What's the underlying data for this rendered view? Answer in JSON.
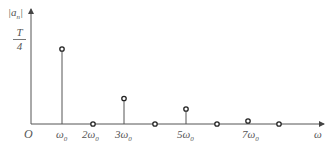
{
  "chart_data": {
    "type": "stem",
    "title": "",
    "xlabel": "ω",
    "ylabel": "|aₙ|",
    "origin_label": "O",
    "y_tick_label": {
      "numerator": "T",
      "denominator": "4"
    },
    "x_tick_labels": [
      "ω₀",
      "2ω₀",
      "3ω₀",
      "5ω₀",
      "7ω₀"
    ],
    "categories": [
      "ω₀",
      "2ω₀",
      "3ω₀",
      "4ω₀",
      "5ω₀",
      "6ω₀",
      "7ω₀",
      "8ω₀"
    ],
    "harmonic": [
      1,
      2,
      3,
      4,
      5,
      6,
      7,
      8
    ],
    "values": [
      0.25,
      0,
      0.085,
      0,
      0.05,
      0,
      0.01,
      0
    ],
    "value_units": "fraction of T",
    "grid": false,
    "legend": null
  },
  "labels": {
    "yaxis": "|a",
    "yaxis_sub": "n",
    "yaxis_close": "|",
    "T": "T",
    "four": "4",
    "origin": "O",
    "w0": "ω",
    "w0_sub": "0",
    "w2": "2ω",
    "w3": "3ω",
    "w5": "5ω",
    "w7": "7ω",
    "sub0": "0",
    "omega": "ω"
  }
}
